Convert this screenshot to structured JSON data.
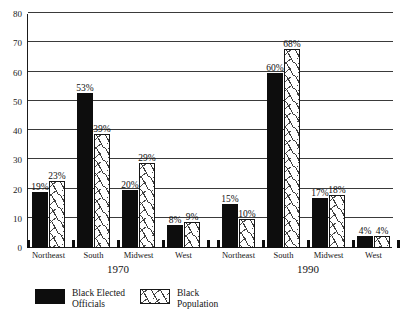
{
  "chart_data": {
    "type": "bar",
    "title": "",
    "subtitle": "",
    "xlabel": "",
    "ylabel": "",
    "ylim": [
      0,
      80
    ],
    "ytick_values": [
      0,
      10,
      20,
      30,
      40,
      50,
      60,
      70,
      80
    ],
    "ytick_labels": [
      "0",
      "10",
      "20",
      "30",
      "40",
      "50",
      "60",
      "70",
      "80"
    ],
    "grid": true,
    "legend_position": "bottom-left",
    "categories": [
      "Northeast",
      "South",
      "Midwest",
      "West"
    ],
    "groups": [
      "1970",
      "1990"
    ],
    "series": [
      {
        "name": "Black Elected Officials",
        "style": "solid-black",
        "values_1970": [
          19,
          53,
          20,
          8
        ],
        "values_1990": [
          15,
          60,
          17,
          4
        ],
        "labels_1970": [
          "19%",
          "53%",
          "20%",
          "8%"
        ],
        "labels_1990": [
          "15%",
          "60%",
          "17%",
          "4%"
        ]
      },
      {
        "name": "Black Population",
        "style": "hatched-white",
        "values_1970": [
          23,
          39,
          29,
          9
        ],
        "values_1990": [
          10,
          68,
          18,
          4
        ],
        "labels_1970": [
          "23%",
          "39%",
          "29%",
          "9%"
        ],
        "labels_1990": [
          "10%",
          "68%",
          "18%",
          "4%"
        ]
      }
    ]
  },
  "legend": {
    "entries": [
      {
        "line1": "Black Elected",
        "line2": "Officials",
        "swatch": "solid-black-swatch"
      },
      {
        "line1": "Black",
        "line2": "Population",
        "swatch": "hatched-white-swatch"
      }
    ]
  },
  "colors": {
    "elected_officials": "#0d0d0d",
    "population_fill": "#ffffff",
    "population_stroke": "#171717",
    "axis": "#1a1a1a",
    "grid": "#3a3a3a",
    "background": "#ffffff"
  }
}
